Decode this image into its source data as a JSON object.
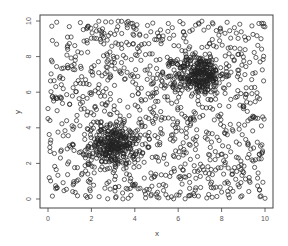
{
  "chart_data": {
    "type": "scatter",
    "title": "",
    "xlabel": "x",
    "ylabel": "y",
    "xlim": [
      -0.4,
      10.4
    ],
    "ylim": [
      -0.5,
      10.4
    ],
    "x_ticks": [
      0,
      2,
      4,
      6,
      8,
      10
    ],
    "y_ticks": [
      0,
      2,
      4,
      6,
      8,
      10
    ],
    "x_tick_labels": [
      "0",
      "2",
      "4",
      "6",
      "8",
      "10"
    ],
    "y_tick_labels": [
      "0",
      "2",
      "4",
      "6",
      "8",
      "10"
    ],
    "grid": false,
    "legend": null,
    "marker": "open-circle",
    "marker_color": "#222222",
    "series": [
      {
        "name": "background-uniform",
        "distribution": "uniform",
        "count": 1000,
        "x_range": [
          0,
          10
        ],
        "y_range": [
          0,
          10
        ]
      },
      {
        "name": "cluster-lower-left",
        "distribution": "gaussian",
        "count": 300,
        "center": [
          3,
          3
        ],
        "sd": 0.55
      },
      {
        "name": "cluster-upper-right",
        "distribution": "gaussian",
        "count": 300,
        "center": [
          7,
          7
        ],
        "sd": 0.55
      }
    ]
  },
  "axes": {
    "x_title": "x",
    "y_title": "y"
  }
}
